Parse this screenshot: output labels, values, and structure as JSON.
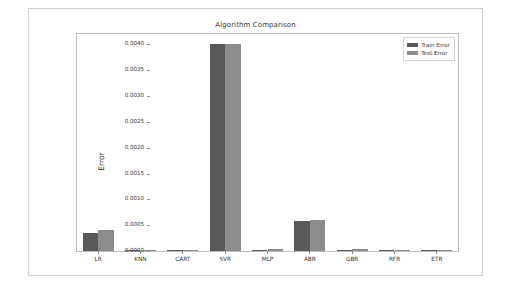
{
  "chart_data": {
    "type": "bar",
    "title": "Algorithm Comparison",
    "xlabel": "",
    "ylabel": "Error",
    "categories": [
      "LR",
      "KNN",
      "CART",
      "SVR",
      "MLP",
      "ABR",
      "GBR",
      "RFR",
      "ETR"
    ],
    "series": [
      {
        "name": "Train Error",
        "color": "#595959",
        "values": [
          0.00035,
          0.0,
          0.0,
          0.004,
          2e-05,
          0.00059,
          2e-05,
          0.0,
          0.0
        ]
      },
      {
        "name": "Test Error",
        "color": "#8c8c8c",
        "values": [
          0.00041,
          1e-05,
          1e-05,
          0.004,
          3e-05,
          0.0006,
          3e-05,
          1e-05,
          1e-05
        ]
      }
    ],
    "ylim": [
      0.0,
      0.0042
    ],
    "yticks": [
      0.0,
      0.0005,
      0.001,
      0.0015,
      0.002,
      0.0025,
      0.003,
      0.0035,
      0.004
    ],
    "ytick_labels": [
      "0.0000",
      "0.0005",
      "0.0010",
      "0.0015",
      "0.0020",
      "0.0025",
      "0.0030",
      "0.0035",
      "0.0040"
    ],
    "grid": false,
    "legend_position": "upper right",
    "legend_entries": [
      "Train Error",
      "Test Error"
    ]
  },
  "figure": {
    "background": "#ffffff",
    "border_color": "#d2d2d2",
    "axes_border_color": "#bdbdbd"
  }
}
